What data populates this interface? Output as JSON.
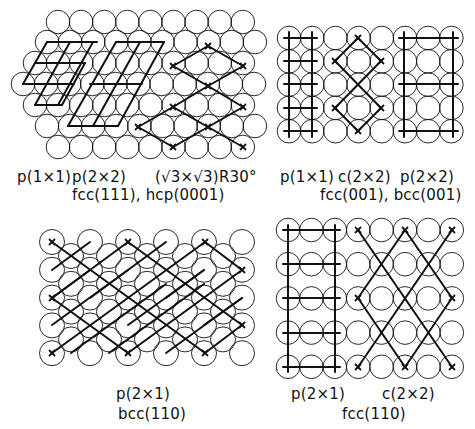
{
  "figure": {
    "stroke_color": "#111111",
    "background": "#ffffff"
  },
  "panels": [
    {
      "id": "hex",
      "surface_label": "fcc(111), hcp(0001)",
      "structure_labels": [
        "p(1×1)",
        "p(2×2)",
        "(√3×√3)R30°"
      ],
      "lattice": "hexagonal",
      "circle_radius": 11.8,
      "rows": [
        {
          "y": 22,
          "x0": 58,
          "n": 9
        },
        {
          "y": 42,
          "x0": 47,
          "n": 10
        },
        {
          "y": 63,
          "x0": 35,
          "n": 10
        },
        {
          "y": 84,
          "x0": 23,
          "n": 11
        },
        {
          "y": 105,
          "x0": 35,
          "n": 10
        },
        {
          "y": 126,
          "x0": 47,
          "n": 10
        },
        {
          "y": 147,
          "x0": 58,
          "n": 9
        }
      ],
      "overlays": [
        {
          "name": "p1x1-cell",
          "lines": [
            [
              47,
              42,
              97,
              42
            ],
            [
              35,
              63,
              85,
              63
            ],
            [
              23,
              84,
              74,
              84
            ],
            [
              35,
              105,
              62,
              105
            ],
            [
              23,
              84,
              47,
              42
            ],
            [
              35,
              105,
              70,
              42
            ],
            [
              58,
              105,
              93,
              42
            ],
            [
              62,
              105,
              85,
              63
            ]
          ]
        },
        {
          "name": "p2x2-cell",
          "lines": [
            [
              116,
              42,
              164,
              42
            ],
            [
              90,
              84,
              142,
              84
            ],
            [
              68,
              126,
              118,
              126
            ],
            [
              68,
              126,
              116,
              42
            ],
            [
              93,
              126,
              140,
              42
            ],
            [
              118,
              126,
              164,
              42
            ]
          ]
        },
        {
          "name": "sqrt3-cell",
          "marks": [
            [
              138,
              127
            ],
            [
              173,
              147
            ],
            [
              173,
              107
            ],
            [
              208,
              127
            ],
            [
              243,
              147
            ],
            [
              208,
              86
            ],
            [
              243,
              107
            ],
            [
              173,
              66
            ],
            [
              208,
              46
            ],
            [
              243,
              66
            ]
          ],
          "lines": [
            [
              138,
              127,
              173,
              147
            ],
            [
              138,
              127,
              173,
              107
            ],
            [
              173,
              107,
              208,
              127
            ],
            [
              173,
              107,
              208,
              86
            ],
            [
              173,
              147,
              208,
              127
            ],
            [
              208,
              127,
              243,
              147
            ],
            [
              208,
              127,
              243,
              107
            ],
            [
              208,
              86,
              243,
              107
            ],
            [
              208,
              86,
              243,
              66
            ],
            [
              173,
              66,
              208,
              86
            ],
            [
              173,
              66,
              208,
              46
            ],
            [
              208,
              46,
              243,
              66
            ]
          ]
        }
      ]
    },
    {
      "id": "square",
      "surface_label": "fcc(001), bcc(001)",
      "structure_labels": [
        "p(1×1)",
        "c(2×2)",
        "p(2×2)"
      ],
      "lattice": "square",
      "circle_radius": 11.8,
      "x0": 289,
      "dx": 23.2,
      "cols": 8,
      "y0": 38,
      "dy": 23.3,
      "nrows": 5,
      "overlays": [
        {
          "name": "p1x1-cell",
          "lines": [
            [
              289,
              32,
              289,
              137
            ],
            [
              312,
              32,
              312,
              137
            ],
            [
              284,
              38,
              317,
              38
            ],
            [
              284,
              61,
              317,
              61
            ],
            [
              284,
              84,
              317,
              84
            ],
            [
              284,
              108,
              317,
              108
            ],
            [
              284,
              131,
              317,
              131
            ]
          ]
        },
        {
          "name": "c2x2-cell",
          "marks": [
            [
              358,
              38
            ],
            [
              335,
              61
            ],
            [
              381,
              61
            ],
            [
              335,
              108
            ],
            [
              381,
              108
            ],
            [
              358,
              131
            ]
          ],
          "lines": [
            [
              358,
              38,
              335,
              61
            ],
            [
              358,
              38,
              381,
              61
            ],
            [
              335,
              61,
              381,
              108
            ],
            [
              381,
              61,
              335,
              108
            ],
            [
              335,
              108,
              358,
              131
            ],
            [
              381,
              108,
              358,
              131
            ]
          ]
        },
        {
          "name": "p2x2-cell",
          "lines": [
            [
              404,
              32,
              404,
              137
            ],
            [
              453,
              32,
              453,
              137
            ],
            [
              399,
              38,
              458,
              38
            ],
            [
              399,
              84,
              458,
              84
            ],
            [
              399,
              131,
              458,
              131
            ]
          ]
        }
      ]
    },
    {
      "id": "bcc110",
      "surface_label": "bcc(110)",
      "structure_labels": [
        "p(2×1)"
      ],
      "lattice": "centered-rectangular",
      "circle_radius": 12.5,
      "corner": {
        "x0": 52,
        "dx": 38,
        "cols": 6,
        "y0": 242,
        "dy": 27.8,
        "nrows": 5
      },
      "center": {
        "x0": 71,
        "dx": 38,
        "cols": 5,
        "y0": 256,
        "dy": 27.8,
        "nrows": 4
      },
      "overlays": [
        {
          "name": "p2x1-cell",
          "marks": [
            [
              52,
              242
            ],
            [
              128,
              242
            ],
            [
              205,
              242
            ],
            [
              52,
              298
            ],
            [
              52,
              353
            ],
            [
              128,
              353
            ],
            [
              205,
              353
            ],
            [
              242,
              270
            ],
            [
              242,
              325
            ]
          ],
          "lines": [
            [
              52,
              242,
              205,
              353
            ],
            [
              128,
              242,
              242,
              325
            ],
            [
              205,
              242,
              242,
              270
            ],
            [
              52,
              298,
              128,
              353
            ],
            [
              52,
              298,
              128,
              242
            ],
            [
              52,
              353,
              205,
              242
            ],
            [
              128,
              353,
              242,
              270
            ],
            [
              205,
              353,
              242,
              325
            ],
            [
              52,
              270,
              90,
              242
            ],
            [
              52,
              325,
              128,
              270
            ],
            [
              71,
              353,
              166,
              284
            ],
            [
              52,
              298,
              90,
              270
            ],
            [
              109,
              353,
              204,
              284
            ],
            [
              90,
              298,
              166,
              242
            ],
            [
              128,
              325,
              204,
              270
            ],
            [
              166,
              353,
              242,
              298
            ],
            [
              166,
              298,
              204,
              270
            ],
            [
              204,
              325,
              242,
              298
            ]
          ]
        }
      ]
    },
    {
      "id": "fcc110",
      "surface_label": "fcc(110)",
      "structure_labels": [
        "p(2×1)",
        "c(2×2)"
      ],
      "lattice": "rectangular",
      "circle_radius": 11.8,
      "x0": 288,
      "dx": 23.4,
      "cols": 8,
      "y0": 230,
      "dy": 34.2,
      "nrows": 5,
      "overlays": [
        {
          "name": "p2x1-cell",
          "lines": [
            [
              288,
              225,
              288,
              372
            ],
            [
              335,
              225,
              335,
              372
            ],
            [
              283,
              230,
              340,
              230
            ],
            [
              283,
              264,
              340,
              264
            ],
            [
              283,
              298,
              340,
              298
            ],
            [
              283,
              333,
              340,
              333
            ],
            [
              283,
              367,
              340,
              367
            ]
          ]
        },
        {
          "name": "c2x2-cell",
          "marks": [
            [
              358,
              230
            ],
            [
              405,
              230
            ],
            [
              452,
              230
            ],
            [
              358,
              298
            ],
            [
              452,
              298
            ],
            [
              358,
              367
            ],
            [
              405,
              367
            ],
            [
              452,
              367
            ]
          ],
          "lines": [
            [
              358,
              230,
              452,
              367
            ],
            [
              452,
              230,
              358,
              367
            ],
            [
              405,
              230,
              358,
              298
            ],
            [
              405,
              230,
              452,
              298
            ],
            [
              358,
              298,
              405,
              367
            ],
            [
              452,
              298,
              405,
              367
            ]
          ]
        }
      ]
    }
  ],
  "labels": [
    {
      "id": "hex-p1x1",
      "text": "p(1×1)",
      "x": 17,
      "y": 170
    },
    {
      "id": "hex-p2x2",
      "text": "p(2×2)",
      "x": 72,
      "y": 170
    },
    {
      "id": "hex-sqrt3",
      "text": "(√3×√3)R30°",
      "x": 155,
      "y": 170
    },
    {
      "id": "hex-surface",
      "text": "fcc(111), hcp(0001)",
      "x": 72,
      "y": 188
    },
    {
      "id": "sq-p1x1",
      "text": "p(1×1)",
      "x": 280,
      "y": 170
    },
    {
      "id": "sq-c2x2",
      "text": "c(2×2)",
      "x": 338,
      "y": 170
    },
    {
      "id": "sq-p2x2",
      "text": "p(2×2)",
      "x": 400,
      "y": 170
    },
    {
      "id": "sq-surface",
      "text": "fcc(001), bcc(001)",
      "x": 320,
      "y": 188
    },
    {
      "id": "bcc110-p2x1",
      "text": "p(2×1)",
      "x": 116,
      "y": 387
    },
    {
      "id": "bcc110-surface",
      "text": "bcc(110)",
      "x": 118,
      "y": 407
    },
    {
      "id": "fcc110-p2x1",
      "text": "p(2×1)",
      "x": 291,
      "y": 387
    },
    {
      "id": "fcc110-c2x2",
      "text": "c(2×2)",
      "x": 382,
      "y": 387
    },
    {
      "id": "fcc110-surface",
      "text": "fcc(110)",
      "x": 342,
      "y": 407
    }
  ]
}
